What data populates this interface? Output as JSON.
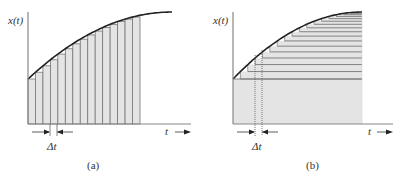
{
  "panels": [
    {
      "id": "a",
      "ylabel": "x(t)",
      "xlabel": "t",
      "delta_label": "Δt",
      "caption": "(a)",
      "decomposition": "vertical strips"
    },
    {
      "id": "b",
      "ylabel": "x(t)",
      "xlabel": "t",
      "delta_label": "Δt",
      "caption": "(b)",
      "decomposition": "horizontal strips"
    }
  ],
  "colors": {
    "axis": "#888888",
    "curve": "#222222",
    "fill": "#e4e4e4",
    "strip_line": "#777777"
  }
}
